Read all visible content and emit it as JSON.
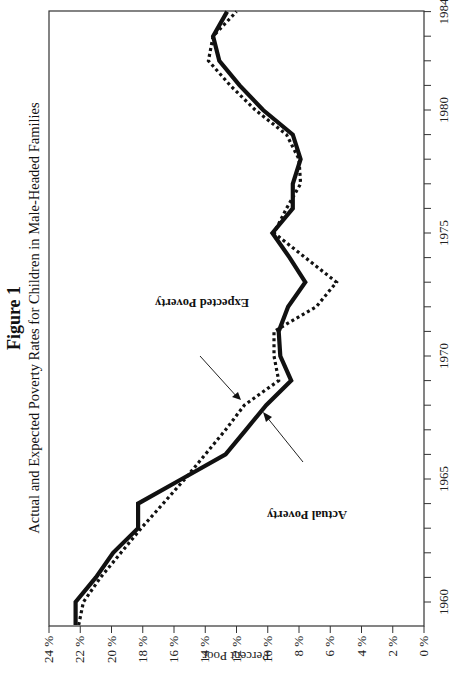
{
  "figure": {
    "label": "Figure 1",
    "title": "Actual and Expected Poverty Rates for Children in Male-Headed Families"
  },
  "annotations": {
    "expected": "Expected Poverty",
    "actual": "Actual Poverty"
  },
  "colors": {
    "line": "#111111",
    "axis": "#333333"
  },
  "chart_data": {
    "type": "line",
    "title": "Actual and Expected Poverty Rates for Children in Male-Headed Families",
    "subtitle": "Figure 1",
    "xlabel": "",
    "ylabel": "Percent Poor",
    "xlim": [
      1959.1,
      1984
    ],
    "ylim": [
      0,
      24
    ],
    "x_ticks": [
      1960,
      1965,
      1970,
      1975,
      1980,
      1984
    ],
    "x_minor_step": 1,
    "y_ticks": [
      0,
      2,
      4,
      6,
      8,
      10,
      12,
      14,
      16,
      18,
      20,
      22,
      24
    ],
    "y_tick_labels": [
      "0 %",
      "2 %",
      "4 %",
      "6 %",
      "8 %",
      "10 %",
      "12 %",
      "14 %",
      "16 %",
      "18 %",
      "20 %",
      "22 %",
      "24 %"
    ],
    "grid": false,
    "legend": "inline annotations with arrows",
    "x": [
      1959,
      1960,
      1961,
      1962,
      1963,
      1964,
      1965,
      1966,
      1967,
      1968,
      1969,
      1970,
      1971,
      1972,
      1973,
      1974,
      1975,
      1976,
      1977,
      1978,
      1979,
      1980,
      1981,
      1982,
      1983,
      1984
    ],
    "series": [
      {
        "name": "Actual Poverty",
        "style": "solid",
        "values": [
          22.3,
          22.3,
          21.0,
          19.9,
          18.3,
          18.3,
          15.5,
          12.7,
          11.4,
          10.1,
          8.5,
          9.2,
          9.3,
          8.7,
          7.6,
          8.6,
          9.7,
          8.4,
          8.4,
          7.9,
          8.4,
          10.3,
          11.8,
          13.1,
          13.5,
          12.6
        ]
      },
      {
        "name": "Expected Poverty",
        "style": "dotted",
        "values": [
          22.1,
          21.8,
          20.7,
          19.4,
          18.1,
          16.7,
          15.3,
          14.0,
          12.7,
          11.5,
          9.3,
          9.6,
          9.6,
          6.9,
          5.6,
          7.6,
          9.6,
          8.8,
          7.9,
          8.0,
          8.8,
          10.8,
          12.4,
          13.8,
          13.5,
          12.0
        ]
      }
    ]
  }
}
